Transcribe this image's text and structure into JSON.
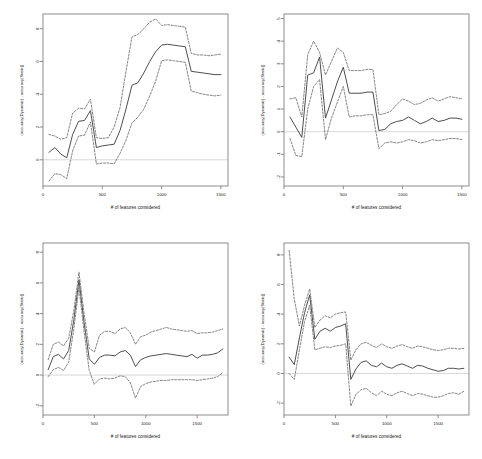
{
  "figure": {
    "title": "",
    "panel_count": 4,
    "layout": "2x2 grid of line plots with dashed confidence bands",
    "colors": {
      "line": "#444444",
      "band": "#666666",
      "zero_line": "#d9d9d9",
      "axis": "#808080",
      "text": "#1a1a1a",
      "background": "#ffffff"
    }
  },
  "chart_data": [
    {
      "type": "line",
      "panel": "top-left",
      "title": "",
      "xlabel": "# of features considered",
      "ylabel": "(accuracy(Dynamic) - accuracy(Static))",
      "xlim": [
        0,
        1560
      ],
      "ylim": [
        -1.6,
        8.9
      ],
      "xticks": [
        0,
        500,
        1000,
        1500
      ],
      "yticks": [
        0,
        2,
        4,
        6,
        8
      ],
      "grid": false,
      "legend": "none",
      "zero_reference_line": 0,
      "x": [
        50,
        100,
        150,
        200,
        250,
        300,
        350,
        400,
        450,
        500,
        550,
        600,
        650,
        700,
        750,
        800,
        850,
        900,
        950,
        1000,
        1050,
        1100,
        1150,
        1200,
        1250,
        1300,
        1350,
        1400,
        1450,
        1500
      ],
      "series": [
        {
          "name": "mean",
          "style": "solid",
          "values": [
            0.45,
            0.75,
            0.35,
            0.12,
            1.55,
            2.35,
            2.4,
            3.0,
            0.75,
            0.85,
            0.9,
            0.95,
            1.8,
            3.1,
            4.55,
            4.7,
            5.3,
            6.0,
            6.6,
            7.0,
            7.05,
            7.0,
            6.95,
            6.9,
            5.4,
            5.35,
            5.3,
            5.25,
            5.2,
            5.2
          ]
        },
        {
          "name": "upper",
          "style": "dashed",
          "values": [
            1.55,
            1.45,
            1.25,
            1.35,
            2.85,
            3.15,
            3.1,
            3.7,
            1.35,
            1.3,
            1.35,
            2.0,
            3.2,
            5.4,
            7.5,
            7.65,
            8.0,
            8.4,
            8.6,
            8.2,
            8.25,
            8.2,
            8.15,
            8.1,
            6.5,
            6.4,
            6.4,
            6.35,
            6.4,
            6.45
          ]
        },
        {
          "name": "lower",
          "style": "dashed",
          "values": [
            -1.3,
            -0.85,
            -0.9,
            -1.15,
            0.55,
            1.45,
            1.5,
            2.3,
            -0.25,
            -0.2,
            -0.2,
            -0.25,
            0.4,
            1.2,
            2.25,
            2.6,
            3.1,
            3.9,
            4.8,
            6.05,
            6.1,
            6.05,
            6.0,
            5.95,
            4.2,
            4.1,
            4.0,
            3.95,
            3.9,
            3.95
          ]
        }
      ]
    },
    {
      "type": "line",
      "panel": "top-right",
      "title": "",
      "xlabel": "# of features considered",
      "ylabel": "(accuracy(Dynamic) - accuracy(Static))",
      "xlim": [
        0,
        1560
      ],
      "ylim": [
        -2.4,
        5.2
      ],
      "xticks": [
        0,
        500,
        1000,
        1500
      ],
      "yticks": [
        -2,
        -1,
        0,
        1,
        2,
        3,
        4,
        5
      ],
      "grid": false,
      "legend": "none",
      "zero_reference_line": 0,
      "x": [
        50,
        100,
        150,
        200,
        250,
        300,
        350,
        400,
        450,
        500,
        550,
        600,
        650,
        700,
        750,
        800,
        850,
        900,
        950,
        1000,
        1050,
        1100,
        1150,
        1200,
        1250,
        1300,
        1350,
        1400,
        1450,
        1500
      ],
      "series": [
        {
          "name": "mean",
          "style": "solid",
          "values": [
            0.65,
            0.2,
            -0.25,
            2.5,
            2.6,
            3.3,
            0.6,
            1.4,
            2.2,
            2.85,
            1.7,
            1.7,
            1.7,
            1.75,
            1.75,
            0.05,
            0.1,
            0.35,
            0.45,
            0.5,
            0.65,
            0.5,
            0.35,
            0.45,
            0.6,
            0.45,
            0.5,
            0.6,
            0.6,
            0.55
          ]
        },
        {
          "name": "upper",
          "style": "dashed",
          "values": [
            1.45,
            1.5,
            0.65,
            3.4,
            4.0,
            3.5,
            2.5,
            3.1,
            3.7,
            3.5,
            2.7,
            2.7,
            2.7,
            2.75,
            2.75,
            0.75,
            0.8,
            0.9,
            1.2,
            1.45,
            1.35,
            1.2,
            1.25,
            1.4,
            1.5,
            1.35,
            1.45,
            1.55,
            1.5,
            1.45
          ]
        },
        {
          "name": "lower",
          "style": "dashed",
          "values": [
            -0.3,
            -1.05,
            -1.1,
            1.0,
            2.0,
            2.3,
            -0.35,
            0.6,
            1.3,
            2.0,
            0.65,
            0.7,
            0.7,
            0.75,
            0.75,
            -0.75,
            -0.5,
            -0.45,
            -0.5,
            -0.45,
            -0.35,
            -0.4,
            -0.5,
            -0.45,
            -0.35,
            -0.4,
            -0.35,
            -0.3,
            -0.3,
            -0.35
          ]
        }
      ]
    },
    {
      "type": "line",
      "panel": "bottom-left",
      "title": "",
      "xlabel": "# of features considered",
      "ylabel": "(accuracy(Dynamic) - accuracy(Static))",
      "xlim": [
        0,
        1800
      ],
      "ylim": [
        -2.6,
        8.6
      ],
      "xticks": [
        0,
        500,
        1000,
        1500
      ],
      "yticks": [
        -2,
        0,
        2,
        4,
        6,
        8
      ],
      "grid": false,
      "legend": "none",
      "zero_reference_line": 0,
      "x": [
        50,
        100,
        150,
        200,
        250,
        300,
        350,
        400,
        450,
        500,
        550,
        600,
        650,
        700,
        750,
        800,
        850,
        900,
        950,
        1000,
        1050,
        1100,
        1150,
        1200,
        1250,
        1300,
        1350,
        1400,
        1450,
        1500,
        1550,
        1600,
        1650,
        1700,
        1750
      ],
      "series": [
        {
          "name": "mean",
          "style": "solid",
          "values": [
            0.35,
            1.2,
            1.35,
            1.05,
            1.6,
            3.6,
            6.2,
            3.4,
            1.05,
            0.7,
            1.15,
            1.3,
            1.3,
            1.25,
            1.5,
            1.6,
            1.3,
            0.55,
            1.0,
            1.15,
            1.25,
            1.3,
            1.35,
            1.4,
            1.35,
            1.3,
            1.25,
            1.2,
            1.35,
            1.1,
            1.3,
            1.3,
            1.35,
            1.45,
            1.7
          ]
        },
        {
          "name": "upper",
          "style": "dashed",
          "values": [
            1.0,
            2.0,
            2.15,
            1.9,
            2.4,
            4.2,
            6.7,
            4.0,
            1.75,
            1.5,
            2.6,
            2.85,
            2.85,
            2.7,
            3.0,
            3.1,
            2.75,
            2.0,
            2.5,
            2.6,
            2.8,
            2.9,
            3.0,
            3.1,
            3.0,
            2.95,
            2.9,
            2.85,
            2.9,
            2.7,
            2.75,
            2.75,
            2.8,
            2.9,
            3.0
          ]
        },
        {
          "name": "lower",
          "style": "dashed",
          "values": [
            -0.1,
            0.35,
            0.5,
            0.3,
            0.85,
            3.0,
            5.7,
            2.8,
            0.3,
            -0.6,
            -0.25,
            -0.2,
            -0.25,
            -0.2,
            -0.05,
            -0.1,
            -0.5,
            -1.5,
            -0.75,
            -0.55,
            -0.45,
            -0.4,
            -0.35,
            -0.35,
            -0.3,
            -0.3,
            -0.3,
            -0.3,
            -0.3,
            -0.35,
            -0.3,
            -0.25,
            -0.2,
            -0.1,
            0.15
          ]
        }
      ]
    },
    {
      "type": "line",
      "panel": "bottom-right",
      "title": "",
      "xlabel": "# of features considered",
      "ylabel": "(accuracy(Dynamic) - accuracy(Static))",
      "xlim": [
        0,
        1800
      ],
      "ylim": [
        -2.8,
        8.8
      ],
      "xticks": [
        0,
        500,
        1000,
        1500
      ],
      "yticks": [
        -2,
        0,
        2,
        4,
        6,
        8
      ],
      "grid": false,
      "legend": "none",
      "zero_reference_line": 0,
      "x": [
        50,
        100,
        150,
        200,
        250,
        300,
        350,
        400,
        450,
        500,
        550,
        600,
        650,
        700,
        750,
        800,
        850,
        900,
        950,
        1000,
        1050,
        1100,
        1150,
        1200,
        1250,
        1300,
        1350,
        1400,
        1450,
        1500,
        1550,
        1600,
        1650,
        1700,
        1750
      ],
      "series": [
        {
          "name": "mean",
          "style": "solid",
          "values": [
            1.1,
            0.6,
            2.4,
            4.1,
            5.3,
            2.3,
            2.85,
            3.05,
            2.85,
            3.1,
            3.2,
            3.35,
            -0.4,
            0.3,
            0.75,
            0.85,
            0.55,
            0.45,
            0.7,
            0.45,
            0.35,
            0.55,
            0.65,
            0.5,
            0.35,
            0.55,
            0.5,
            0.35,
            0.25,
            0.15,
            0.2,
            0.35,
            0.35,
            0.3,
            0.35
          ]
        },
        {
          "name": "upper",
          "style": "dashed",
          "values": [
            8.3,
            5.0,
            3.2,
            4.6,
            5.7,
            3.1,
            3.6,
            3.9,
            3.75,
            4.0,
            4.1,
            4.15,
            0.9,
            1.6,
            2.0,
            2.1,
            1.9,
            1.75,
            2.0,
            1.8,
            1.7,
            1.85,
            1.95,
            1.8,
            1.7,
            1.85,
            1.8,
            1.7,
            1.6,
            1.55,
            1.6,
            1.7,
            1.7,
            1.65,
            1.7
          ]
        },
        {
          "name": "lower",
          "style": "dashed",
          "values": [
            0.0,
            -0.4,
            1.6,
            3.5,
            4.6,
            1.6,
            1.7,
            1.8,
            1.75,
            1.85,
            1.9,
            2.0,
            -2.2,
            -1.4,
            -1.1,
            -1.0,
            -1.3,
            -1.5,
            -1.2,
            -1.4,
            -1.5,
            -1.3,
            -1.2,
            -1.35,
            -1.5,
            -1.35,
            -1.4,
            -1.5,
            -1.6,
            -1.6,
            -1.5,
            -1.35,
            -1.3,
            -1.4,
            -1.2
          ]
        }
      ]
    }
  ]
}
